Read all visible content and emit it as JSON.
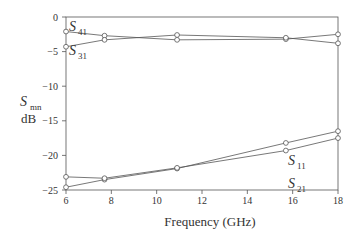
{
  "chart_data": {
    "type": "line",
    "title": "",
    "xlabel": "Frequency (GHz)",
    "ylabel_main": "S",
    "ylabel_sub": "mn",
    "ylabel_unit": "dB",
    "xlim": [
      6,
      18
    ],
    "ylim": [
      -25,
      0
    ],
    "xticks": [
      6,
      8,
      10,
      12,
      14,
      16,
      18
    ],
    "yticks": [
      0,
      -5,
      -10,
      -15,
      -20,
      -25
    ],
    "grid": false,
    "x": [
      6,
      7.7,
      10.9,
      15.7,
      18
    ],
    "series": [
      {
        "name": "S41",
        "label_main": "S",
        "label_sub": "41",
        "values": [
          -2.1,
          -2.7,
          -3.3,
          -3.2,
          -2.5
        ]
      },
      {
        "name": "S31",
        "label_main": "S",
        "label_sub": "31",
        "values": [
          -4.3,
          -3.3,
          -2.6,
          -3.0,
          -3.8
        ]
      },
      {
        "name": "S11",
        "label_main": "S",
        "label_sub": "11",
        "values": [
          -24.6,
          -23.5,
          -21.9,
          -18.2,
          -16.5
        ]
      },
      {
        "name": "S21",
        "label_main": "S",
        "label_sub": "21",
        "values": [
          -23.1,
          -23.3,
          -21.8,
          -19.3,
          -17.5
        ]
      }
    ]
  }
}
